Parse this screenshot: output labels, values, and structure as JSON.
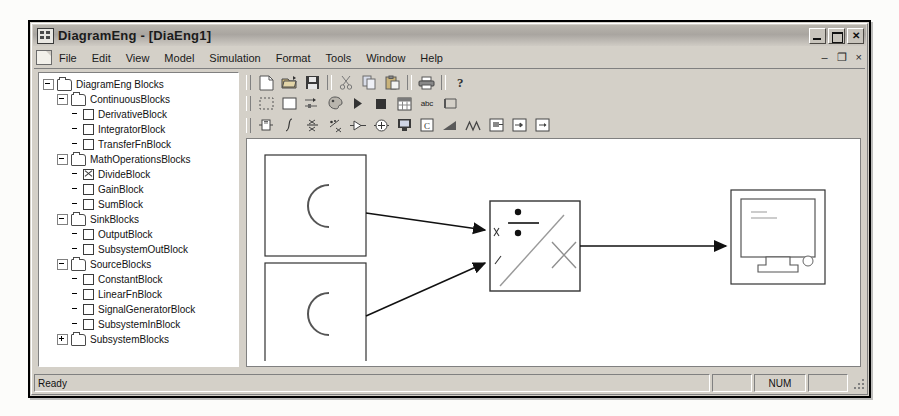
{
  "window": {
    "title": "DiagramEng - [DiaEng1]",
    "app_icon": "diagram-app-icon",
    "controls": {
      "minimize": "minimize-button",
      "maximize": "maximize-button",
      "close": "close-button"
    },
    "mdi_controls": {
      "minimize": "–",
      "restore": "❐",
      "close": "×"
    }
  },
  "menubar": {
    "doc_icon": "document-icon",
    "items": [
      {
        "label": "File"
      },
      {
        "label": "Edit"
      },
      {
        "label": "View"
      },
      {
        "label": "Model"
      },
      {
        "label": "Simulation"
      },
      {
        "label": "Format"
      },
      {
        "label": "Tools"
      },
      {
        "label": "Window"
      },
      {
        "label": "Help"
      }
    ]
  },
  "tree": {
    "nodes": [
      {
        "level": 1,
        "toggle": "minus",
        "type": "folder",
        "label": "DiagramEng Blocks"
      },
      {
        "level": 2,
        "toggle": "minus",
        "type": "folder",
        "label": "ContinuousBlocks"
      },
      {
        "level": 3,
        "toggle": "none",
        "type": "leaf",
        "label": "DerivativeBlock"
      },
      {
        "level": 3,
        "toggle": "none",
        "type": "leaf",
        "label": "IntegratorBlock"
      },
      {
        "level": 3,
        "toggle": "none",
        "type": "leaf",
        "label": "TransferFnBlock"
      },
      {
        "level": 2,
        "toggle": "minus",
        "type": "folder",
        "label": "MathOperationsBlocks"
      },
      {
        "level": 3,
        "toggle": "none",
        "type": "leaf-checked",
        "label": "DivideBlock"
      },
      {
        "level": 3,
        "toggle": "none",
        "type": "leaf",
        "label": "GainBlock"
      },
      {
        "level": 3,
        "toggle": "none",
        "type": "leaf",
        "label": "SumBlock"
      },
      {
        "level": 2,
        "toggle": "minus",
        "type": "folder",
        "label": "SinkBlocks"
      },
      {
        "level": 3,
        "toggle": "none",
        "type": "leaf",
        "label": "OutputBlock"
      },
      {
        "level": 3,
        "toggle": "none",
        "type": "leaf",
        "label": "SubsystemOutBlock"
      },
      {
        "level": 2,
        "toggle": "minus",
        "type": "folder",
        "label": "SourceBlocks"
      },
      {
        "level": 3,
        "toggle": "none",
        "type": "leaf",
        "label": "ConstantBlock"
      },
      {
        "level": 3,
        "toggle": "none",
        "type": "leaf",
        "label": "LinearFnBlock"
      },
      {
        "level": 3,
        "toggle": "none",
        "type": "leaf",
        "label": "SignalGeneratorBlock"
      },
      {
        "level": 3,
        "toggle": "none",
        "type": "leaf",
        "label": "SubsystemInBlock"
      },
      {
        "level": 2,
        "toggle": "plus",
        "type": "folder",
        "label": "SubsystemBlocks"
      }
    ]
  },
  "toolbars": {
    "standard": [
      {
        "icon": "new-file-icon"
      },
      {
        "icon": "open-folder-icon"
      },
      {
        "icon": "save-disk-icon"
      },
      {
        "icon": "separator"
      },
      {
        "icon": "cut-scissors-icon"
      },
      {
        "icon": "copy-icon"
      },
      {
        "icon": "paste-icon"
      },
      {
        "icon": "separator"
      },
      {
        "icon": "print-icon"
      },
      {
        "icon": "separator"
      },
      {
        "icon": "help-question-icon"
      }
    ],
    "model": [
      {
        "icon": "select-dashed-rect-icon"
      },
      {
        "icon": "rectangle-icon"
      },
      {
        "icon": "connect-signal-icon"
      },
      {
        "icon": "palette-icon"
      },
      {
        "icon": "run-play-icon"
      },
      {
        "icon": "stop-square-icon"
      },
      {
        "icon": "grid-table-icon"
      },
      {
        "icon": "abc-text-icon",
        "text": "abc"
      },
      {
        "icon": "annotate-icon"
      }
    ],
    "blocks": [
      {
        "icon": "derivative-block-icon"
      },
      {
        "icon": "integrator-block-icon"
      },
      {
        "icon": "transfer-fn-block-icon"
      },
      {
        "icon": "divide-block-icon"
      },
      {
        "icon": "gain-block-icon"
      },
      {
        "icon": "sum-block-icon"
      },
      {
        "icon": "output-block-icon"
      },
      {
        "icon": "constant-block-icon"
      },
      {
        "icon": "linear-fn-block-icon"
      },
      {
        "icon": "signal-generator-block-icon"
      },
      {
        "icon": "subsystem-block-icon"
      },
      {
        "icon": "subsystem-in-block-icon"
      },
      {
        "icon": "subsystem-out-block-icon"
      }
    ]
  },
  "canvas": {
    "blocks": [
      {
        "name": "constant-block-1",
        "glyph": "C",
        "x": 18,
        "y": 16,
        "w": 101,
        "h": 101
      },
      {
        "name": "constant-block-2",
        "glyph": "C",
        "x": 18,
        "y": 124,
        "w": 101,
        "h": 101
      },
      {
        "name": "divide-block",
        "glyph": "÷",
        "x": 243,
        "y": 62,
        "w": 90,
        "h": 90,
        "selected": true
      },
      {
        "name": "output-block",
        "glyph": "monitor",
        "x": 484,
        "y": 51,
        "w": 94,
        "h": 94
      }
    ],
    "connections": [
      {
        "name": "connection-const1-to-divide",
        "from": "constant-block-1",
        "to": "divide-block"
      },
      {
        "name": "connection-const2-to-divide",
        "from": "constant-block-2",
        "to": "divide-block"
      },
      {
        "name": "connection-divide-to-output",
        "from": "divide-block",
        "to": "output-block"
      }
    ]
  },
  "statusbar": {
    "message": "Ready",
    "cells": [
      "",
      "NUM",
      ""
    ]
  },
  "colors": {
    "window_face": "#d4d0c8",
    "canvas": "#ffffff",
    "outline": "#333333",
    "titlebar_from": "#b9b5ad",
    "titlebar_to": "#cfcbc4"
  }
}
